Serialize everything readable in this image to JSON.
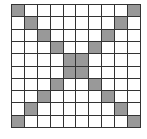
{
  "grid": {
    "rows": 10,
    "cols": 10,
    "filled_color": "#999999",
    "empty_color": "#ffffff",
    "line_color": "#333333",
    "filled_cells": [
      [
        0,
        0
      ],
      [
        0,
        9
      ],
      [
        1,
        1
      ],
      [
        1,
        8
      ],
      [
        2,
        2
      ],
      [
        2,
        7
      ],
      [
        3,
        3
      ],
      [
        3,
        6
      ],
      [
        4,
        4
      ],
      [
        4,
        5
      ],
      [
        5,
        4
      ],
      [
        5,
        5
      ],
      [
        6,
        3
      ],
      [
        6,
        6
      ],
      [
        7,
        2
      ],
      [
        7,
        7
      ],
      [
        8,
        1
      ],
      [
        8,
        8
      ],
      [
        9,
        0
      ],
      [
        9,
        9
      ]
    ]
  }
}
